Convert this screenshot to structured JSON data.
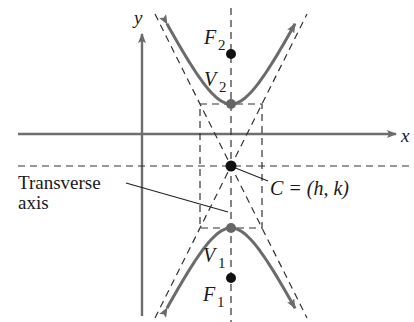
{
  "diagram": {
    "type": "vertical-hyperbola",
    "axes": {
      "x_label": "x",
      "y_label": "y"
    },
    "labels": {
      "focus_top": "F",
      "focus_top_sub": "2",
      "vertex_top": "V",
      "vertex_top_sub": "2",
      "vertex_bottom": "V",
      "vertex_bottom_sub": "1",
      "focus_bottom": "F",
      "focus_bottom_sub": "1",
      "center": "C = (h, k)",
      "transverse_line1": "Transverse",
      "transverse_line2": "axis"
    },
    "colors": {
      "curve": "#6b6b6b",
      "axis": "#6e6e6e",
      "dashed": "#333333",
      "point": "#111111",
      "vertex_point": "#666666",
      "text": "#1a1a1a"
    },
    "geometry": {
      "center": [
        231,
        166
      ],
      "a": 62,
      "b": 31,
      "foci_offset": 112
    }
  }
}
